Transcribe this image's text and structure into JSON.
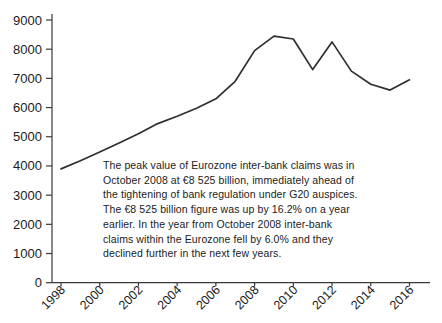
{
  "figure": {
    "background": "#ffffff"
  },
  "chart_data": {
    "type": "line",
    "title": "",
    "xlabel": "",
    "ylabel": "",
    "grid": false,
    "legend": "none",
    "x": [
      1998,
      1999,
      2000,
      2001,
      2002,
      2003,
      2004,
      2005,
      2006,
      2007,
      2008,
      2009,
      2010,
      2011,
      2012,
      2013,
      2014,
      2015,
      2016
    ],
    "values": [
      3900,
      4180,
      4480,
      4790,
      5100,
      5450,
      5700,
      5980,
      6300,
      6900,
      7950,
      8450,
      8350,
      7300,
      8250,
      7250,
      6800,
      6600,
      6950
    ],
    "xticks": [
      1998,
      2000,
      2002,
      2004,
      2006,
      2008,
      2010,
      2012,
      2014,
      2016
    ],
    "yticks": [
      0,
      1000,
      2000,
      3000,
      4000,
      5000,
      6000,
      7000,
      8000,
      9000
    ],
    "ylim": [
      0,
      9000
    ],
    "colors": {
      "line": "#2e2e2e",
      "axis": "#3a3a3a",
      "tick_text": "#1b1b1b"
    },
    "annotation_lines": [
      "The peak value of Eurozone inter-bank claims was in",
      "October 2008 at €8 525 billion, immediately ahead of",
      "the tightening of bank regulation under G20 auspices.",
      "The €8 525 billion figure was up by 16.2% on a year",
      "earlier. In the year from October 2008 inter-bank",
      "claims within the Eurozone fell by 6.0% and they",
      "declined further in the next few years."
    ]
  }
}
